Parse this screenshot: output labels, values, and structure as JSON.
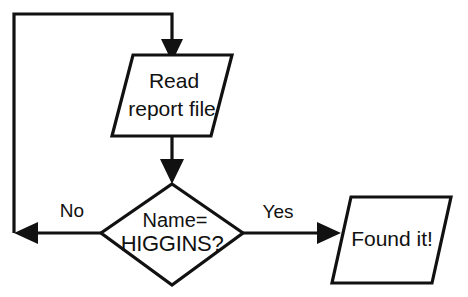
{
  "diagram": {
    "background_color": "#ffffff",
    "line_color": "#111111",
    "nodes": {
      "read_report": {
        "shape": "parallelogram",
        "line1": "Read",
        "line2": "report file"
      },
      "name_check": {
        "shape": "diamond",
        "line1": "Name=",
        "line2": "HIGGINS?"
      },
      "found_it": {
        "shape": "parallelogram",
        "line1": "Found it!"
      }
    },
    "edges": {
      "no_label": "No",
      "yes_label": "Yes"
    }
  }
}
